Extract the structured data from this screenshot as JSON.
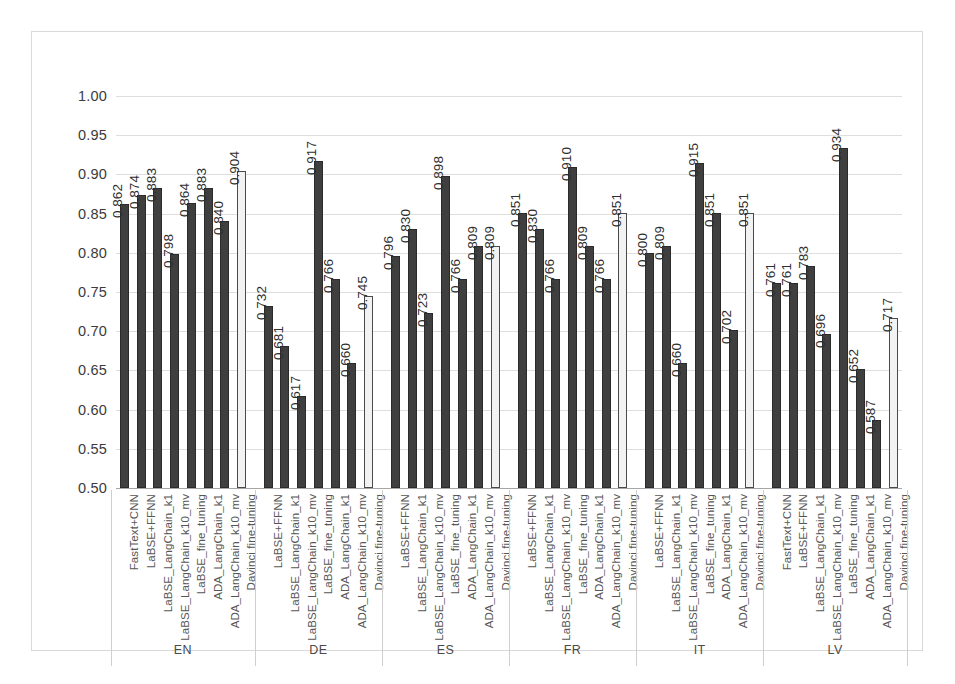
{
  "chart_data": {
    "type": "bar",
    "title": "",
    "xlabel": "",
    "ylabel": "",
    "ylim": [
      0.5,
      1.0
    ],
    "ytick_step": 0.05,
    "yticks": [
      "1.00",
      "0.95",
      "0.90",
      "0.85",
      "0.80",
      "0.75",
      "0.70",
      "0.65",
      "0.60",
      "0.55",
      "0.50"
    ],
    "grid": true,
    "legend": "none",
    "colors": {
      "dark_bar": "#3f3f3f",
      "light_bar": "#f2f2f2",
      "light_bar_outline": "#4a4a4a",
      "gridline": "#dedede",
      "frame": "#d9d9d9",
      "text": "#3b3b3b"
    },
    "series_names": [
      "FastText+CNN",
      "LaBSE+FFNN",
      "LaBSE_LangChain_k1",
      "LaBSE_LangChain_k10_mv",
      "LaBSE_fine_tuning",
      "ADA_LangChain_k1",
      "ADA_LangChain_k10_mv",
      "Davinci fine-tuning"
    ],
    "groups": [
      {
        "label": "EN",
        "bars": [
          {
            "category": "FastText+CNN",
            "value": 0.862,
            "style": "dark"
          },
          {
            "category": "LaBSE+FFNN",
            "value": 0.874,
            "style": "dark"
          },
          {
            "category": "LaBSE_LangChain_k1",
            "value": 0.883,
            "style": "dark"
          },
          {
            "category": "LaBSE_LangChain_k10_mv",
            "value": 0.798,
            "style": "dark"
          },
          {
            "category": "LaBSE_fine_tuning",
            "value": 0.864,
            "style": "dark"
          },
          {
            "category": "ADA_LangChain_k1",
            "value": 0.883,
            "style": "dark"
          },
          {
            "category": "ADA_LangChain_k10_mv",
            "value": 0.84,
            "style": "dark"
          },
          {
            "category": "Davinci fine-tuning",
            "value": 0.904,
            "style": "light"
          }
        ]
      },
      {
        "label": "DE",
        "bars": [
          {
            "category": "LaBSE+FFNN",
            "value": 0.732,
            "style": "dark"
          },
          {
            "category": "LaBSE_LangChain_k1",
            "value": 0.681,
            "style": "dark"
          },
          {
            "category": "LaBSE_LangChain_k10_mv",
            "value": 0.617,
            "style": "dark"
          },
          {
            "category": "LaBSE_fine_tuning",
            "value": 0.917,
            "style": "dark"
          },
          {
            "category": "ADA_LangChain_k1",
            "value": 0.766,
            "style": "dark"
          },
          {
            "category": "ADA_LangChain_k10_mv",
            "value": 0.66,
            "style": "dark"
          },
          {
            "category": "Davinci fine-tuning",
            "value": 0.745,
            "style": "light"
          }
        ]
      },
      {
        "label": "ES",
        "bars": [
          {
            "category": "LaBSE+FFNN",
            "value": 0.796,
            "style": "dark"
          },
          {
            "category": "LaBSE_LangChain_k1",
            "value": 0.83,
            "style": "dark"
          },
          {
            "category": "LaBSE_LangChain_k10_mv",
            "value": 0.723,
            "style": "dark"
          },
          {
            "category": "LaBSE_fine_tuning",
            "value": 0.898,
            "style": "dark"
          },
          {
            "category": "ADA_LangChain_k1",
            "value": 0.766,
            "style": "dark"
          },
          {
            "category": "ADA_LangChain_k10_mv",
            "value": 0.809,
            "style": "dark"
          },
          {
            "category": "Davinci fine-tuning",
            "value": 0.809,
            "style": "light"
          }
        ]
      },
      {
        "label": "FR",
        "bars": [
          {
            "category": "LaBSE+FFNN",
            "value": 0.851,
            "style": "dark"
          },
          {
            "category": "LaBSE_LangChain_k1",
            "value": 0.83,
            "style": "dark"
          },
          {
            "category": "LaBSE_LangChain_k10_mv",
            "value": 0.766,
            "style": "dark"
          },
          {
            "category": "LaBSE_fine_tuning",
            "value": 0.91,
            "style": "dark"
          },
          {
            "category": "ADA_LangChain_k1",
            "value": 0.809,
            "style": "dark"
          },
          {
            "category": "ADA_LangChain_k10_mv",
            "value": 0.766,
            "style": "dark"
          },
          {
            "category": "Davinci fine-tuning",
            "value": 0.851,
            "style": "light"
          }
        ]
      },
      {
        "label": "IT",
        "bars": [
          {
            "category": "LaBSE+FFNN",
            "value": 0.8,
            "style": "dark"
          },
          {
            "category": "LaBSE_LangChain_k1",
            "value": 0.809,
            "style": "dark"
          },
          {
            "category": "LaBSE_LangChain_k10_mv",
            "value": 0.66,
            "style": "dark"
          },
          {
            "category": "LaBSE_fine_tuning",
            "value": 0.915,
            "style": "dark"
          },
          {
            "category": "ADA_LangChain_k1",
            "value": 0.851,
            "style": "dark"
          },
          {
            "category": "ADA_LangChain_k10_mv",
            "value": 0.702,
            "style": "dark"
          },
          {
            "category": "Davinci fine-tuning",
            "value": 0.851,
            "style": "light"
          }
        ]
      },
      {
        "label": "LV",
        "bars": [
          {
            "category": "FastText+CNN",
            "value": 0.761,
            "style": "dark"
          },
          {
            "category": "LaBSE+FFNN",
            "value": 0.761,
            "style": "dark"
          },
          {
            "category": "LaBSE_LangChain_k1",
            "value": 0.783,
            "style": "dark"
          },
          {
            "category": "LaBSE_LangChain_k10_mv",
            "value": 0.696,
            "style": "dark"
          },
          {
            "category": "LaBSE_fine_tuning",
            "value": 0.934,
            "style": "dark"
          },
          {
            "category": "ADA_LangChain_k1",
            "value": 0.652,
            "style": "dark"
          },
          {
            "category": "ADA_LangChain_k10_mv",
            "value": 0.587,
            "style": "dark"
          },
          {
            "category": "Davinci fine-tuning",
            "value": 0.717,
            "style": "light"
          }
        ]
      }
    ]
  }
}
